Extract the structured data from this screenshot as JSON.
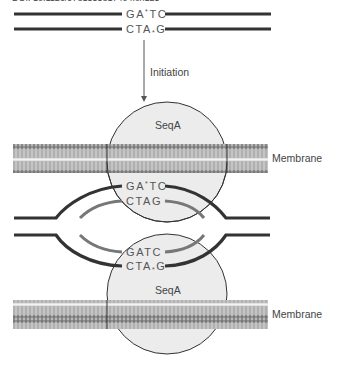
{
  "caption": "DOI: 10.1126/9781555817404.ch125",
  "diagram": {
    "top_strands": {
      "upper_seq": "GA*TC",
      "lower_seq": "CTA*G",
      "upper_parts": [
        "GA",
        "*",
        "TC"
      ],
      "lower_parts": [
        "CTA",
        "*",
        "G"
      ]
    },
    "arrow_label": "Initiation",
    "protein_label": "SeqA",
    "membrane_label": "Membrane",
    "bubble": {
      "old_top_seq": [
        "GA",
        "*",
        "TC"
      ],
      "new_top_seq": "CTAG",
      "new_bottom_seq": "GATC",
      "old_bottom_seq": [
        "CTA",
        "*",
        "G"
      ]
    },
    "colors": {
      "old_strand": "#333333",
      "new_strand": "#777777",
      "circle_fill": "#ececec",
      "circle_stroke": "#333333",
      "membrane_head": "#7a7a7a",
      "membrane_tail": "#b0b0b0",
      "text": "#555555"
    }
  }
}
